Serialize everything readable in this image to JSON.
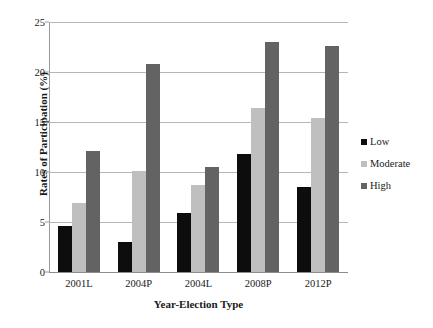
{
  "chart_data": {
    "type": "bar",
    "title": "",
    "xlabel": "Year-Election Type",
    "ylabel": "Rates of Participation (%)",
    "categories": [
      "2001L",
      "2004P",
      "2004L",
      "2008P",
      "2012P"
    ],
    "series": [
      {
        "name": "Low",
        "color": "#0d0d0d",
        "values": [
          4.6,
          3.0,
          5.9,
          11.8,
          8.5
        ]
      },
      {
        "name": "Moderate",
        "color": "#bfbfbf",
        "values": [
          6.9,
          10.1,
          8.7,
          16.4,
          15.4
        ]
      },
      {
        "name": "High",
        "color": "#636363",
        "values": [
          12.1,
          20.8,
          10.5,
          23.0,
          22.6
        ]
      }
    ],
    "ylim": [
      0,
      25
    ],
    "yticks": [
      0,
      5,
      10,
      15,
      20,
      25
    ],
    "ytick_labels": [
      "0",
      "5",
      "10",
      "15",
      "20",
      "25"
    ],
    "grid": true,
    "legend_position": "right"
  }
}
